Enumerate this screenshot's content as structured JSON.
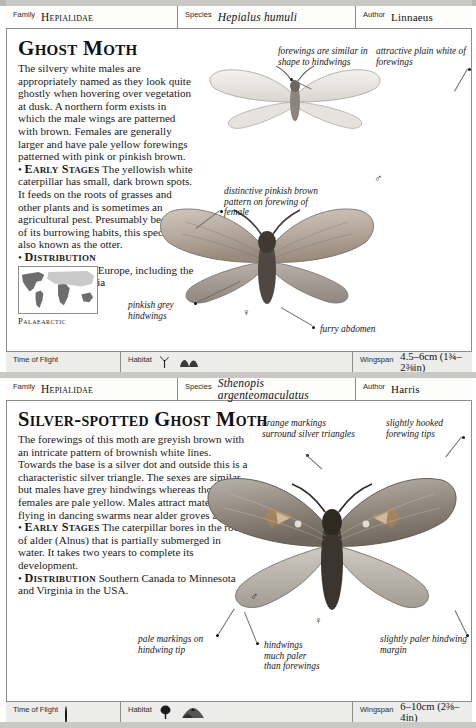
{
  "entries": [
    {
      "header": {
        "family_label": "Family",
        "family_value": "Hepialidae",
        "species_label": "Species",
        "species_value": "Hepialus humuli",
        "author_label": "Author",
        "author_value": "Linnaeus"
      },
      "title": "Ghost Moth",
      "body": {
        "intro": "The silvery white males are appropriately named as they look quite ghostly when hovering over vegetation at dusk. A northern form exists in which the male wings are patterned with brown. Females are generally larger and have pale yellow forewings patterned with pink or pinkish brown.",
        "early_stages_head": "Early Stages",
        "early_stages_text": "The yellowish white caterpillar has small, dark brown spots. It feeds on the roots of grasses and other plants and is sometimes an agricultural pest. Presumably because of its burrowing habits, this species is also known as the otter.",
        "distribution_head": "Distribution",
        "distribution_text": "Widespread from Europe, including the British Isles to Asia"
      },
      "map_caption": "Palaearctic",
      "annotations": [
        "forewings are similar in shape to hindwings",
        "attractive plain white of forewings",
        "distinctive pinkish brown pattern on forewing of female",
        "pinkish grey hindwings",
        "furry abdomen"
      ],
      "gender_male": "♂",
      "gender_female": "♀",
      "footer": {
        "time_of_flight_label": "Time of Flight",
        "time_of_flight_icon": "crescent-moon-icon",
        "habitat_label": "Habitat",
        "habitat_icons": [
          "grass-tuft-icon",
          "low-scrub-icon"
        ],
        "wingspan_label": "Wingspan",
        "wingspan_value": "4.5–6cm (1¾–2⅜in)"
      }
    },
    {
      "header": {
        "family_label": "Family",
        "family_value": "Hepialidae",
        "species_label": "Species",
        "species_value": "Sthenopis argenteomaculatus",
        "author_label": "Author",
        "author_value": "Harris"
      },
      "title": "Silver-spotted Ghost Moth",
      "body": {
        "intro": "The forewings of this moth are greyish brown with an intricate pattern of brownish white lines. Towards the base is a silver dot and outside this is a characteristic silver triangle. The sexes are similar, but males have grey hindwings whereas those of females are pale yellow. Males attract mates by flying in dancing swarms near alder groves at dusk.",
        "early_stages_head": "Early Stages",
        "early_stages_text": "The caterpillar bores in the roots of alder (Alnus) that is partially submerged in water. It takes two years to complete its development.",
        "early_stages_italic": "Alnus",
        "distribution_head": "Distribution",
        "distribution_text": "Southern Canada to Minnesota and Virginia in the USA."
      },
      "map_caption": "Nearctic",
      "annotations": [
        "orange markings surround silver triangles",
        "slightly hooked forewing tips",
        "pale markings on hindwing tip",
        "hindwings much paler than forewings",
        "slightly paler hindwing margin"
      ],
      "gender_male": "♂",
      "gender_female": "♀",
      "footer": {
        "time_of_flight_label": "Time of Flight",
        "time_of_flight_icon": "half-disc-icon",
        "habitat_label": "Habitat",
        "habitat_icons": [
          "tree-icon",
          "wooded-hill-icon"
        ],
        "wingspan_label": "Wingspan",
        "wingspan_value": "6–10cm (2⅜–4in)"
      }
    }
  ],
  "colors": {
    "page_border": "#8d8d8a",
    "footer_bg": "#ecececb",
    "map_land": "#6d6d6d",
    "map_highlight": "#c9c9c9",
    "text": "#1a1a1a"
  }
}
